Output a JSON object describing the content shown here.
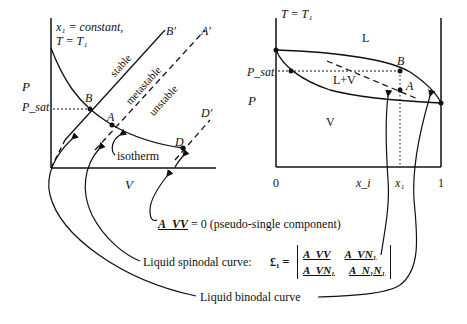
{
  "left_plot": {
    "annotation_line1": "x₁ = constant,",
    "annotation_line2": "T = T₁",
    "y_axis_label": "P",
    "y_tick_label": "P_sat",
    "x_axis_label": "V",
    "regions": [
      "stable",
      "metastable",
      "unstable"
    ],
    "points": [
      "B",
      "A",
      "D"
    ],
    "line_ends": [
      "B′",
      "A′",
      "D′"
    ],
    "isotherm_label": "isotherm"
  },
  "right_plot": {
    "annotation": "T = T₁",
    "y_label_sat": "P_sat",
    "y_label": "P",
    "region_L": "L",
    "region_LV": "L+V",
    "region_V": "V",
    "points": [
      "B",
      "A"
    ],
    "x_ticks": [
      "0",
      "x_i",
      "x₁",
      "1"
    ]
  },
  "annotations": {
    "pseudo_single": "= 0 (pseudo-single component)",
    "pseudo_single_symbol": "A_VV",
    "spinodal_label": "Liquid spinodal curve:",
    "spinodal_symbol": "£₁ =",
    "determinant": [
      [
        "A_VV",
        "A_VN₁"
      ],
      [
        "A_VN₁",
        "A_N₁N₁"
      ]
    ],
    "binodal_label": "Liquid binodal curve"
  }
}
